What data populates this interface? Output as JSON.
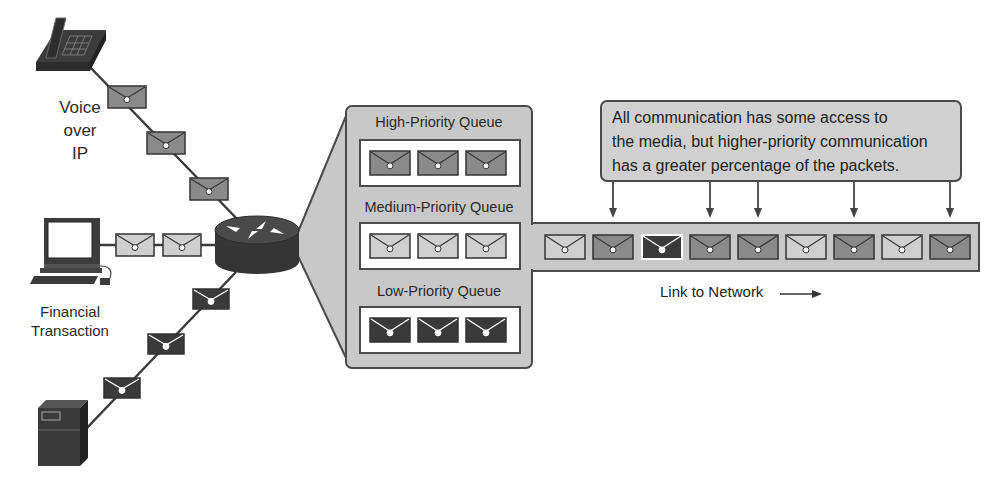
{
  "sources": {
    "voice": {
      "label_lines": [
        "Voice",
        "over",
        "IP"
      ],
      "icon": "ip-phone-icon"
    },
    "financial": {
      "label_lines": [
        "Financial",
        "Transaction"
      ],
      "icon": "workstation-icon"
    },
    "server": {
      "label_lines": [],
      "icon": "server-icon"
    }
  },
  "router": {
    "icon": "router-icon"
  },
  "queues": [
    {
      "title": "High-Priority Queue",
      "packet_shade": "high",
      "packets": 3
    },
    {
      "title": "Medium-Priority Queue",
      "packet_shade": "medium",
      "packets": 3
    },
    {
      "title": "Low-Priority Queue",
      "packet_shade": "low",
      "packets": 3
    }
  ],
  "callout": {
    "text_lines": [
      "All communication has some access to",
      "the media, but higher-priority communication",
      "has a greater percentage of the packets."
    ]
  },
  "link": {
    "label": "Link to Network",
    "packet_sequence": [
      "medium",
      "high",
      "low",
      "high",
      "high",
      "medium",
      "high",
      "medium",
      "high"
    ],
    "arrow_targets": [
      1,
      3,
      4,
      6,
      8
    ]
  },
  "colors": {
    "high": "#8a8a8a",
    "medium": "#cfcfcf",
    "low": "#3a3a3a",
    "panel": "#c8c8c8",
    "stroke": "#4a4a4a",
    "device": "#3c3c3c"
  }
}
